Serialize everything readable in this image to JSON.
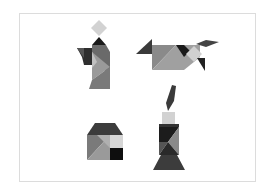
{
  "figures": [
    {
      "name": "person",
      "position": "top-left"
    },
    {
      "name": "dog",
      "position": "top-right"
    },
    {
      "name": "house",
      "position": "bottom-left"
    },
    {
      "name": "candle",
      "position": "bottom-right"
    }
  ],
  "colors": {
    "light": "#d4d4d4",
    "mid": "#8a8a8a",
    "midlight": "#a8a8a8",
    "dark": "#3a3a3a",
    "black": "#111111",
    "frame": "#dcdcdc"
  }
}
